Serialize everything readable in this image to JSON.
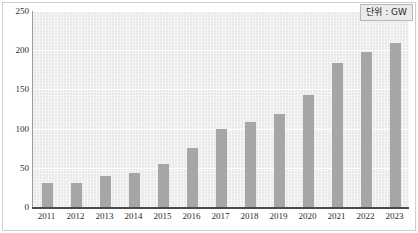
{
  "chart_data": {
    "type": "bar",
    "title": "",
    "subtitle": "",
    "xlabel": "",
    "ylabel": "",
    "unit_label": "단위 : GW",
    "categories": [
      "2011",
      "2012",
      "2013",
      "2014",
      "2015",
      "2016",
      "2017",
      "2018",
      "2019",
      "2020",
      "2021",
      "2022",
      "2023"
    ],
    "values": [
      30,
      31,
      40,
      44,
      55,
      75,
      100,
      108,
      119,
      143,
      184,
      198,
      209
    ],
    "series": [
      {
        "name": "",
        "values": [
          30,
          31,
          40,
          44,
          55,
          75,
          100,
          108,
          119,
          143,
          184,
          198,
          209
        ]
      }
    ],
    "ylim": [
      0,
      250
    ],
    "yticks": [
      0,
      50,
      100,
      150,
      200,
      250
    ],
    "ytick_labels": [
      "0",
      "50",
      "100",
      "150",
      "200",
      "250"
    ],
    "xlim_categories": 13,
    "grid": true,
    "grid_axis": "y",
    "legend": false,
    "legend_position": "none",
    "annotations": [
      "단위 : GW"
    ],
    "colors": {
      "bar": "#a6a6a6",
      "plot_background": "#e9e9e9",
      "gridline": "#ffffff",
      "axis": "#4a4a4a",
      "text": "#2b2b2b",
      "frame": "#cfcfcf",
      "legend_background": "#ebebeb",
      "legend_border": "#b9b9b9"
    }
  }
}
